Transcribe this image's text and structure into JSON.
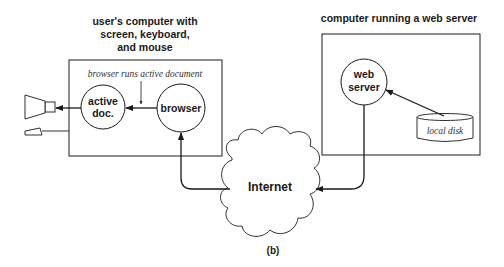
{
  "figure": {
    "caption": "(b)",
    "colors": {
      "stroke": "#1a1a1a",
      "background": "#ffffff"
    }
  },
  "client": {
    "title_lines": [
      "user's computer with",
      "screen, keyboard,",
      "and mouse"
    ],
    "box_label": "browser runs active document",
    "active_doc_lines": [
      "active",
      "doc."
    ],
    "browser_label": "browser",
    "devices": [
      "screen-icon",
      "keyboard-icon"
    ]
  },
  "server": {
    "title": "computer running a web server",
    "web_server_lines": [
      "web",
      "server"
    ],
    "disk_label": "local disk"
  },
  "network": {
    "label": "Internet"
  }
}
